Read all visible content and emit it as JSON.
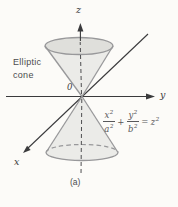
{
  "figure": {
    "name_line1": "Elliptic",
    "name_line2": "cone",
    "origin_label": "0",
    "caption": "(a)",
    "axes": {
      "x_label": "x",
      "y_label": "y",
      "z_label": "z"
    },
    "equation": {
      "num1_base": "x",
      "num1_exp": "2",
      "den1_base": "a",
      "den1_exp": "2",
      "plus": "+",
      "num2_base": "y",
      "num2_exp": "2",
      "den2_base": "b",
      "den2_exp": "2",
      "equals": "=",
      "rhs_base": "z",
      "rhs_exp": "2"
    },
    "colors": {
      "background": "#fcfbf8",
      "cone_fill": "#ebebe8",
      "cone_opening_fill": "#dfdfdb",
      "cone_stroke": "#98989a",
      "axis": "#3a3a3c",
      "hidden_line": "#4e4e50",
      "text": "#4b4b4d",
      "equation_text": "#58585a"
    }
  }
}
